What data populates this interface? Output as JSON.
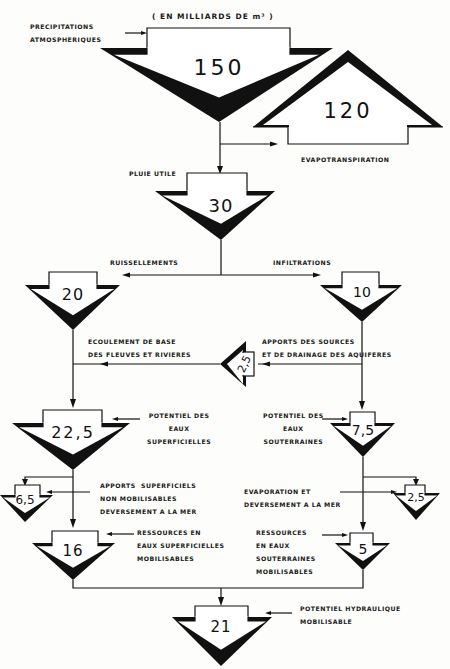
{
  "title": "( EN  MILLIARDS DE m³ )",
  "nodes": {
    "precipitations": {
      "value": "150",
      "label": "PRECIPITATIONS\nATMOSPHERIQUES"
    },
    "evapotranspiration": {
      "value": "120",
      "label": "EVAPOTRANSPIRATION"
    },
    "pluie_utile": {
      "value": "30",
      "label": "PLUIE UTILE"
    },
    "ruissellements": {
      "value": "20",
      "label": "RUISSELLEMENTS"
    },
    "infiltrations": {
      "value": "10",
      "label": "INFILTRATIONS"
    },
    "ecoulement_base": {
      "value": "2,5",
      "label": "ECOULEMENT DE BASE\nDES FLEUVES ET RIVIERES"
    },
    "apports_sources": {
      "label": "APPORTS DES SOURCES\nET DE DRAINAGE DES AQUIFERES"
    },
    "potentiel_superficielles": {
      "value": "22,5",
      "label": "POTENTIEL DES\nEAUX\nSUPERFICIELLES"
    },
    "potentiel_souterraines": {
      "value": "7,5",
      "label": "POTENTIEL DES\nEAUX\nSOUTERRAINES"
    },
    "apports_non_mobilisables": {
      "value": "6,5",
      "label": "APPORTS  SUPERFICIELS\nNON MOBILISABLES\nDEVERSEMENT A LA MER"
    },
    "evaporation_deversement": {
      "value": "2,5",
      "label": "EVAPORATION ET\nDEVERSEMENT A LA MER"
    },
    "ressources_superficielles": {
      "value": "16",
      "label": "RESSOURCES EN\nEAUX SUPERFICIELLES\nMOBILISABLES"
    },
    "ressources_souterraines": {
      "value": "5",
      "label": "RESSOURCES\nEN EAUX\nSOUTERRAINES\nMOBILISABLES"
    },
    "potentiel_hydraulique": {
      "value": "21",
      "label": "POTENTIEL HYDRAULIQUE\nMOBILISABLE"
    }
  }
}
